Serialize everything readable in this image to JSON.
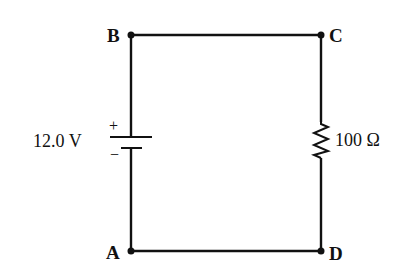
{
  "diagram": {
    "type": "circuit",
    "nodes": [
      {
        "id": "A",
        "label": "A"
      },
      {
        "id": "B",
        "label": "B"
      },
      {
        "id": "C",
        "label": "C"
      },
      {
        "id": "D",
        "label": "D"
      }
    ],
    "battery": {
      "label": "12.0 V",
      "positive_sign": "+",
      "negative_sign": "−",
      "between": [
        "A",
        "B"
      ]
    },
    "resistor": {
      "label": "100 Ω",
      "between": [
        "C",
        "D"
      ]
    },
    "wires": [
      [
        "B",
        "C"
      ],
      [
        "A",
        "D"
      ]
    ],
    "colors": {
      "line": "#111111",
      "background": "#ffffff"
    }
  }
}
